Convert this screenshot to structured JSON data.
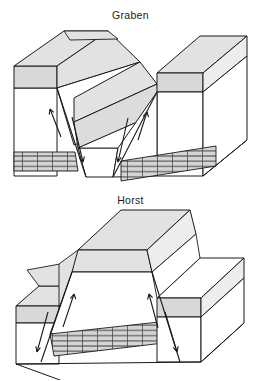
{
  "document": {
    "title": "Graben and Horst fault block diagrams",
    "background_color": "#ffffff",
    "width": 261,
    "height": 381
  },
  "palette": {
    "outline": "#1a1a1a",
    "soil_layer_gray": "#d8d8d8",
    "top_surface_gray": "#e2e2e2",
    "side_face_gray": "#ededed",
    "fault_face_gray": "#dcdcdc",
    "rock_white": "#ffffff",
    "brick_band_gray": "#d5d5d5",
    "brick_line": "#1a1a1a",
    "label_text": "#1a1a1a"
  },
  "figures": [
    {
      "id": "graben",
      "label": "Graben",
      "description": "Block diagram of a graben: a central crustal block dropped down between two normal faults that dip toward each other.",
      "central_block_motion": "down",
      "fault_type": "normal",
      "fault_count": 2,
      "layers": [
        {
          "name": "soil-cap",
          "pattern": "solid-gray"
        },
        {
          "name": "bedrock",
          "pattern": "blank-white"
        },
        {
          "name": "marker-bed",
          "pattern": "brick"
        }
      ],
      "brick_rows": 3,
      "arrow_pairs": 2
    },
    {
      "id": "horst",
      "label": "Horst",
      "description": "Block diagram of a horst: a central crustal block raised up between two normal faults that dip away from each other.",
      "central_block_motion": "up",
      "fault_type": "normal",
      "fault_count": 2,
      "layers": [
        {
          "name": "soil-cap",
          "pattern": "solid-gray"
        },
        {
          "name": "bedrock",
          "pattern": "blank-white"
        },
        {
          "name": "marker-bed",
          "pattern": "brick"
        }
      ],
      "brick_rows": 3,
      "arrow_pairs": 2
    }
  ]
}
